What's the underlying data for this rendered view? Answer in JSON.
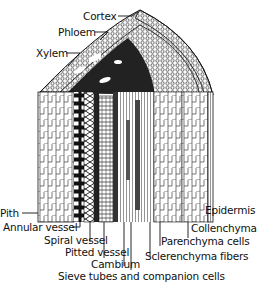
{
  "diagram": {
    "labels_top": [
      {
        "id": "cortex",
        "text": "Cortex"
      },
      {
        "id": "phloem",
        "text": "Phloem"
      },
      {
        "id": "xylem",
        "text": "Xylem"
      }
    ],
    "labels_bottom": [
      {
        "id": "pith",
        "text": "Pith"
      },
      {
        "id": "annular-vessel",
        "text": "Annular vessel"
      },
      {
        "id": "spiral-vessel",
        "text": "Spiral vessel"
      },
      {
        "id": "pitted-vessel",
        "text": "Pitted vessel"
      },
      {
        "id": "cambium",
        "text": "Cambium"
      },
      {
        "id": "sieve-tubes",
        "text": "Sieve tubes and companion cells"
      },
      {
        "id": "sclerenchyma",
        "text": "Sclerenchyma fibers"
      },
      {
        "id": "parenchyma",
        "text": "Parenchyma cells"
      },
      {
        "id": "collenchyma",
        "text": "Collenchyma"
      },
      {
        "id": "epidermis",
        "text": "Epidermis"
      }
    ]
  }
}
